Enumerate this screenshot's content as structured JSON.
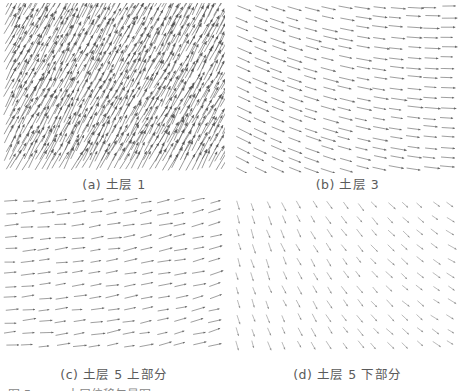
{
  "figure": {
    "panels": [
      {
        "id": "a",
        "label": "(a) 土层 1",
        "field": "dense",
        "angle_deg": -62,
        "length": 22,
        "spacing_x": 6,
        "spacing_y": 9,
        "color": "#444444",
        "opacity": 0.75
      },
      {
        "id": "b",
        "label": "(b) 土层 3",
        "field": "curving-right",
        "angle_deg": 18,
        "length": 15,
        "spacing_x": 17,
        "spacing_y": 10,
        "color": "#555555",
        "opacity": 0.8
      },
      {
        "id": "c",
        "label": "(c) 土层 5 上部分",
        "field": "rightward-up",
        "angle_deg": -8,
        "length": 13,
        "spacing_x": 17,
        "spacing_y": 12,
        "color": "#555555",
        "opacity": 0.8
      },
      {
        "id": "d",
        "label": "(d) 土层 5 下部分",
        "field": "downward-right",
        "angle_deg": 55,
        "length": 9,
        "spacing_x": 15,
        "spacing_y": 14,
        "color": "#777777",
        "opacity": 0.7
      }
    ],
    "caption_partial": "图 5　…　土层位移矢量图"
  }
}
